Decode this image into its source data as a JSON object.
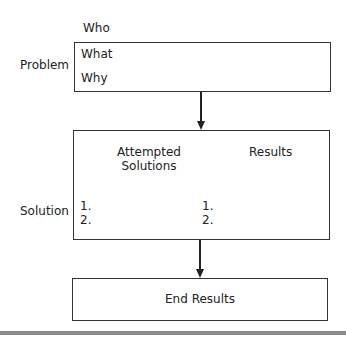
{
  "diagram": {
    "problem": {
      "side_label": "Problem",
      "items": [
        "Who",
        "What",
        "Why"
      ]
    },
    "solution": {
      "side_label": "Solution",
      "columns": [
        {
          "header_line1": "Attempted",
          "header_line2": "Solutions",
          "list": [
            "1.",
            "2."
          ]
        },
        {
          "header_line1": "Results",
          "header_line2": "",
          "list": [
            "1.",
            "2."
          ]
        }
      ]
    },
    "end": {
      "label": "End Results"
    },
    "colors": {
      "stroke": "#333333",
      "rule": "#8a8a8a"
    }
  }
}
